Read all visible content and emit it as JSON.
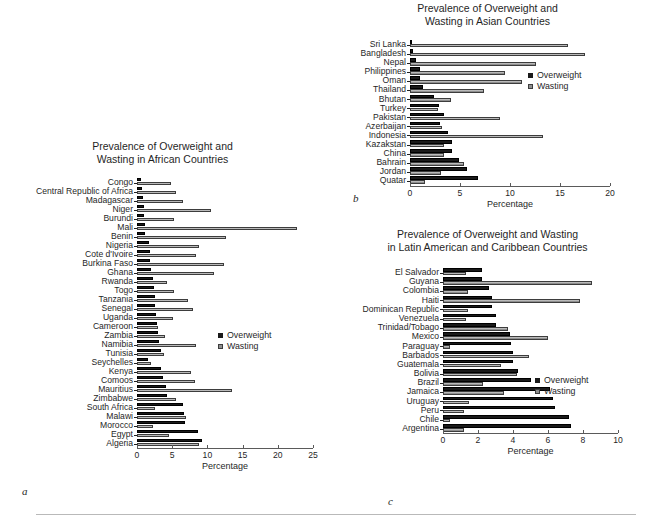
{
  "figure": {
    "legend": {
      "overweight_label": "Overweight",
      "wasting_label": "Wasting",
      "overweight_color": "#1a1a1a",
      "wasting_color": "#8f8f8f"
    },
    "panel_letters": {
      "a": "a",
      "b": "b",
      "c": "c"
    },
    "axis_title": "Percentage"
  },
  "chart_data": [
    {
      "id": "a",
      "type": "bar",
      "orientation": "horizontal",
      "title": "Prevalence of Overweight and\nWasting in African Countries",
      "xlabel": "Percentage",
      "ylabel": "",
      "xlim": [
        0,
        25
      ],
      "xticks": [
        0,
        5,
        10,
        15,
        20,
        25
      ],
      "grid": false,
      "legend_position": "center-right",
      "categories": [
        "Congo",
        "Central Republic of Africa",
        "Madagascar",
        "Niger",
        "Burundi",
        "Mali",
        "Benin",
        "Nigeria",
        "Cote d'Ivoire",
        "Burkina Faso",
        "Ghana",
        "Rwanda",
        "Togo",
        "Tanzania",
        "Senegal",
        "Uganda",
        "Cameroon",
        "Zambia",
        "Namibia",
        "Tunisia",
        "Seychelles",
        "Kenya",
        "Comoos",
        "Mauritius",
        "Zimbabwe",
        "South Africa",
        "Malawi",
        "Morocco",
        "Egypt",
        "Algeria"
      ],
      "series": [
        {
          "name": "Overweight",
          "values": [
            0.6,
            0.7,
            0.8,
            1.0,
            1.0,
            1.1,
            1.2,
            1.7,
            1.8,
            1.8,
            2.0,
            2.3,
            2.4,
            2.5,
            2.5,
            2.7,
            2.8,
            3.0,
            3.1,
            3.4,
            1.5,
            3.4,
            3.7,
            4.1,
            4.2,
            6.6,
            6.7,
            6.8,
            8.7,
            9.2
          ]
        },
        {
          "name": "Wasting",
          "values": [
            4.8,
            5.6,
            6.6,
            10.5,
            5.3,
            22.7,
            12.6,
            8.8,
            8.4,
            12.3,
            10.9,
            4.2,
            5.2,
            7.3,
            8.0,
            5.1,
            3.0,
            4.0,
            8.4,
            3.8,
            2.0,
            7.7,
            8.2,
            13.5,
            5.5,
            2.6,
            7.0,
            2.3,
            4.5,
            8.8
          ]
        }
      ]
    },
    {
      "id": "b",
      "type": "bar",
      "orientation": "horizontal",
      "title": "Prevalence of Overweight and\nWasting in Asian Countries",
      "xlabel": "Percentage",
      "ylabel": "",
      "xlim": [
        0,
        20
      ],
      "xticks": [
        0,
        5,
        10,
        15,
        20
      ],
      "grid": false,
      "legend_position": "center-right",
      "categories": [
        "Sri Lanka",
        "Bangladesh",
        "Nepal",
        "Philippines",
        "Oman",
        "Thailand",
        "Bhutan",
        "Turkey",
        "Pakistan",
        "Azerbaijan",
        "Indonesia",
        "Kazakstan",
        "China",
        "Bahrain",
        "Jordan",
        "Quatar"
      ],
      "series": [
        {
          "name": "Overweight",
          "values": [
            0.2,
            0.3,
            0.6,
            1.0,
            1.0,
            1.3,
            2.4,
            2.9,
            3.4,
            3.0,
            3.8,
            4.2,
            4.2,
            4.9,
            5.7,
            6.8
          ]
        },
        {
          "name": "Wasting",
          "values": [
            15.8,
            17.5,
            12.6,
            9.5,
            11.2,
            7.4,
            4.1,
            2.8,
            9.0,
            3.2,
            13.3,
            3.4,
            3.4,
            5.4,
            3.1,
            1.5
          ]
        }
      ]
    },
    {
      "id": "c",
      "type": "bar",
      "orientation": "horizontal",
      "title": "Prevalence of Overweight and Wasting\nin Latin American and Caribbean Countries",
      "xlabel": "Percentage",
      "ylabel": "",
      "xlim": [
        0,
        10
      ],
      "xticks": [
        0,
        2,
        4,
        6,
        8,
        10
      ],
      "grid": false,
      "legend_position": "center-right",
      "categories": [
        "El Salvador",
        "Guyana",
        "Colombia",
        "Haiti",
        "Dominican Republic",
        "Venezuela",
        "Trinidad/Tobago",
        "Mexico",
        "Paraguay",
        "Barbados",
        "Guatemala",
        "Bolivia",
        "Brazil",
        "Jamaica",
        "Uruguay",
        "Peru",
        "Chile",
        "Argentina"
      ],
      "series": [
        {
          "name": "Overweight",
          "values": [
            2.2,
            2.2,
            2.6,
            2.8,
            2.8,
            3.0,
            3.0,
            3.8,
            3.9,
            4.0,
            4.0,
            4.3,
            5.0,
            6.1,
            6.3,
            6.4,
            7.2,
            7.3
          ]
        },
        {
          "name": "Wasting",
          "values": [
            1.3,
            8.5,
            1.4,
            7.8,
            1.4,
            1.3,
            3.7,
            6.0,
            0.4,
            4.9,
            3.3,
            4.2,
            2.3,
            3.5,
            1.5,
            1.2,
            0.4,
            1.2
          ]
        }
      ]
    }
  ]
}
